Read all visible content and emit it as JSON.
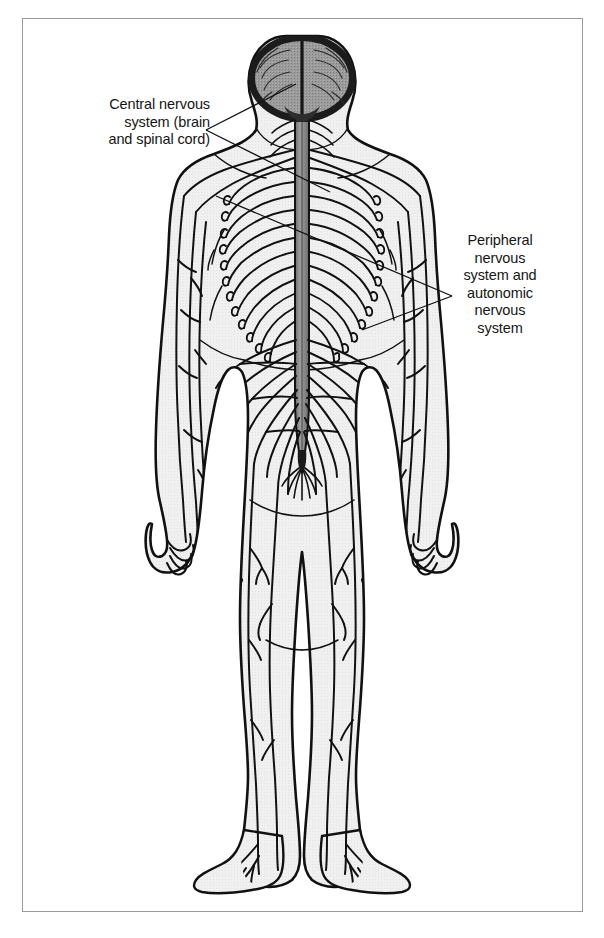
{
  "figure": {
    "view": "posterior full-body anatomical illustration",
    "frame": {
      "border_color": "#9a9a9a",
      "background": "#ffffff"
    },
    "colors": {
      "ink": "#111111",
      "body_fill": "#efefef",
      "brain_fill": "#9b9b9b",
      "spinal_cord_fill": "#8e8e8e",
      "label_text": "#161616",
      "frame_border": "#9a9a9a",
      "page_background": "#ffffff"
    },
    "labels": [
      {
        "id": "cns",
        "name": "central-nervous-system-label",
        "text": "Central nervous\nsystem (brain\nand spinal cord)",
        "align": "right",
        "leader": "forked-v-pointing-right"
      },
      {
        "id": "pns",
        "name": "peripheral-nervous-system-label",
        "text": "Peripheral\nnervous\nsystem and\nautonomic\nnervous\nsystem",
        "align": "center",
        "leader": "forked-v-pointing-left"
      }
    ],
    "structures": [
      "brain",
      "brainstem",
      "spinal cord",
      "cervical plexus",
      "brachial plexus",
      "intercostal nerves",
      "lumbar plexus",
      "sacral plexus",
      "cauda equina",
      "radial nerve",
      "ulnar nerve",
      "median nerve",
      "femoral nerve",
      "sciatic nerve",
      "tibial nerve",
      "peroneal nerve",
      "plantar nerves"
    ],
    "intercostal_nerve_pairs": 12
  }
}
